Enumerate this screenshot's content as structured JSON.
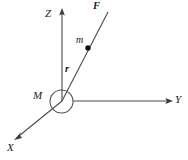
{
  "figure": {
    "background_color": "#ffffff",
    "line_color": "#4a4a4a",
    "text_color": "#1a1a1a",
    "width": 188,
    "height": 160
  },
  "axes": {
    "origin": {
      "x": 62,
      "y": 101
    },
    "items": [
      {
        "name": "z-axis",
        "label": "Z",
        "direction": "up",
        "from": {
          "x": 62,
          "y": 101
        },
        "to": {
          "x": 62,
          "y": 9
        },
        "arrow": true
      },
      {
        "name": "y-axis",
        "label": "Y",
        "direction": "right",
        "from": {
          "x": 73,
          "y": 101
        },
        "to": {
          "x": 173,
          "y": 101
        },
        "arrow": true
      },
      {
        "name": "x-axis",
        "label": "X",
        "direction": "down-left",
        "from": {
          "x": 62,
          "y": 101
        },
        "to": {
          "x": 14,
          "y": 140
        },
        "arrow": true
      }
    ]
  },
  "bodies": {
    "central_mass": {
      "label": "M",
      "shape": "circle",
      "center": {
        "x": 61.5,
        "y": 101.5
      },
      "radius": 11.5
    },
    "point_mass": {
      "label": "m",
      "shape": "dot",
      "center": {
        "x": 88,
        "y": 48
      },
      "radius": 2.6
    }
  },
  "vectors": {
    "force": {
      "label": "F",
      "style": "bold-italic",
      "from": {
        "x": 62,
        "y": 101
      },
      "to": {
        "x": 108,
        "y": 12
      }
    },
    "position": {
      "label": "r",
      "style": "bold-italic",
      "from": {
        "x": 62,
        "y": 101
      },
      "to": {
        "x": 88,
        "y": 48
      }
    }
  },
  "labels": {
    "z": "Z",
    "y": "Y",
    "x": "X",
    "force": "F",
    "position": "r",
    "central_mass": "M",
    "point_mass": "m"
  }
}
